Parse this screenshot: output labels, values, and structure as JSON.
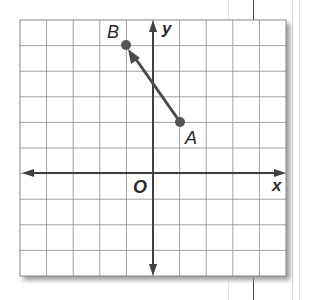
{
  "figure": {
    "type": "coordinate-plane",
    "grid": {
      "cols": 10,
      "rows": 10,
      "x_min": -5,
      "x_max": 5,
      "y_min": -4,
      "y_max": 6
    },
    "axes": {
      "x_label": "x",
      "y_label": "y",
      "origin_label": "O"
    },
    "points": [
      {
        "name": "A",
        "x": 1,
        "y": 2
      },
      {
        "name": "B",
        "x": -1,
        "y": 5
      }
    ],
    "vector": {
      "from": "A",
      "to": "B",
      "description": "Arrow from A to B"
    },
    "colors": {
      "grid": "#8a8a8a",
      "axis": "#404040",
      "vector": "#4a4a4a",
      "point": "#555555",
      "shadow": "#9a9a9a"
    }
  }
}
